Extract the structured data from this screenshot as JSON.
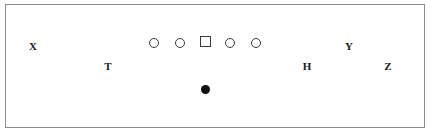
{
  "diagram": {
    "type": "football-play-diagram",
    "canvas": {
      "width": 432,
      "height": 136
    },
    "colors": {
      "background": "#ffffff",
      "border": "#8b8b8b",
      "marker_outline": "#3a3a3a",
      "ball_fill": "#111111",
      "label_text": "#1a1a1a"
    },
    "field_box": {
      "left": 5,
      "top": 4,
      "width": 420,
      "height": 124,
      "border_width": 1
    }
  },
  "markers": [
    {
      "id": "lineman-left-tackle",
      "shape": "circle",
      "label": "",
      "cx": 153,
      "cy": 42,
      "size": 10,
      "filled": false
    },
    {
      "id": "lineman-left-guard",
      "shape": "circle",
      "label": "",
      "cx": 179,
      "cy": 42,
      "size": 10,
      "filled": false
    },
    {
      "id": "center",
      "shape": "square",
      "label": "",
      "cx": 204,
      "cy": 40,
      "size": 11,
      "filled": false
    },
    {
      "id": "lineman-right-guard",
      "shape": "circle",
      "label": "",
      "cx": 229,
      "cy": 42,
      "size": 10,
      "filled": false
    },
    {
      "id": "lineman-right-tackle",
      "shape": "circle",
      "label": "",
      "cx": 255,
      "cy": 42,
      "size": 10,
      "filled": false
    },
    {
      "id": "quarterback-ball",
      "shape": "dot",
      "label": "",
      "cx": 204,
      "cy": 88,
      "size": 9,
      "filled": true
    }
  ],
  "labels": [
    {
      "id": "position-x",
      "text": "X",
      "cx": 32,
      "cy": 45,
      "font_size": 11
    },
    {
      "id": "position-t",
      "text": "T",
      "cx": 107,
      "cy": 65,
      "font_size": 11
    },
    {
      "id": "position-h",
      "text": "H",
      "cx": 306,
      "cy": 65,
      "font_size": 11
    },
    {
      "id": "position-y",
      "text": "Y",
      "cx": 348,
      "cy": 45,
      "font_size": 11
    },
    {
      "id": "position-z",
      "text": "Z",
      "cx": 387,
      "cy": 65,
      "font_size": 11
    }
  ]
}
